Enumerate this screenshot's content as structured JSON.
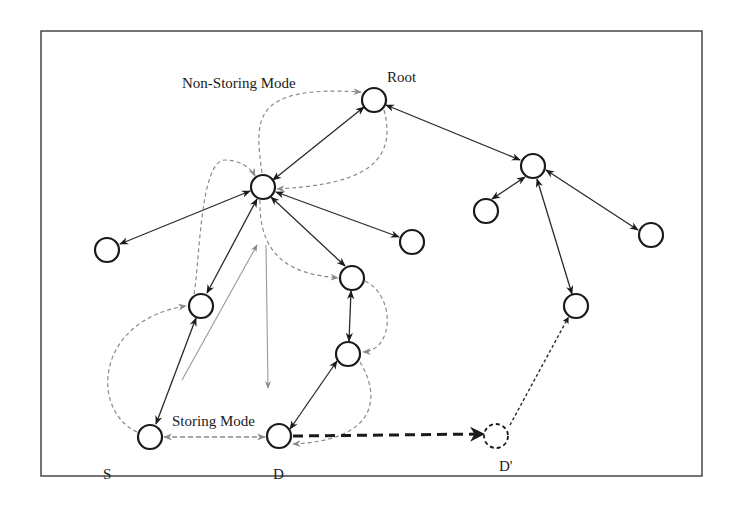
{
  "diagram": {
    "labels": {
      "non_storing_mode": "Non-Storing Mode",
      "storing_mode": "Storing Mode",
      "root": "Root",
      "source": "S",
      "destination": "D",
      "destination_moved": "D'"
    },
    "nodes": [
      {
        "id": "root",
        "label": "Root",
        "style": "solid"
      },
      {
        "id": "hub-left",
        "label": "",
        "style": "solid"
      },
      {
        "id": "leaf-far-left",
        "label": "",
        "style": "solid"
      },
      {
        "id": "parent-of-s",
        "label": "",
        "style": "solid"
      },
      {
        "id": "s",
        "label": "S",
        "style": "solid"
      },
      {
        "id": "mid-1",
        "label": "",
        "style": "solid"
      },
      {
        "id": "mid-2",
        "label": "",
        "style": "solid"
      },
      {
        "id": "d",
        "label": "D",
        "style": "solid"
      },
      {
        "id": "leaf-right-of-hub",
        "label": "",
        "style": "solid"
      },
      {
        "id": "hub-right",
        "label": "",
        "style": "solid"
      },
      {
        "id": "hub-right-child-1",
        "label": "",
        "style": "solid"
      },
      {
        "id": "hub-right-child-2",
        "label": "",
        "style": "solid"
      },
      {
        "id": "hub-right-child-3",
        "label": "",
        "style": "solid"
      },
      {
        "id": "d-moved",
        "label": "D'",
        "style": "dashed"
      }
    ],
    "edges": [
      {
        "from": "root",
        "to": "hub-left",
        "type": "tree-bidirectional"
      },
      {
        "from": "root",
        "to": "hub-right",
        "type": "tree-bidirectional"
      },
      {
        "from": "hub-left",
        "to": "leaf-far-left",
        "type": "tree-bidirectional"
      },
      {
        "from": "hub-left",
        "to": "parent-of-s",
        "type": "tree-bidirectional"
      },
      {
        "from": "hub-left",
        "to": "mid-1",
        "type": "tree-bidirectional"
      },
      {
        "from": "hub-left",
        "to": "leaf-right-of-hub",
        "type": "tree-bidirectional"
      },
      {
        "from": "parent-of-s",
        "to": "s",
        "type": "tree-bidirectional"
      },
      {
        "from": "mid-1",
        "to": "mid-2",
        "type": "tree-bidirectional"
      },
      {
        "from": "mid-2",
        "to": "d",
        "type": "tree-bidirectional"
      },
      {
        "from": "hub-right",
        "to": "hub-right-child-1",
        "type": "tree-bidirectional"
      },
      {
        "from": "hub-right",
        "to": "hub-right-child-2",
        "type": "tree-bidirectional"
      },
      {
        "from": "hub-right",
        "to": "hub-right-child-3",
        "type": "tree-bidirectional"
      },
      {
        "from": "d",
        "to": "d-moved",
        "type": "mobility-move"
      },
      {
        "from": "d-moved",
        "to": "hub-right-child-3",
        "type": "new-attachment"
      },
      {
        "from": "s",
        "to": "d",
        "type": "storing-mode-route"
      },
      {
        "from": "s",
        "to": "root",
        "type": "non-storing-mode-route"
      }
    ]
  }
}
